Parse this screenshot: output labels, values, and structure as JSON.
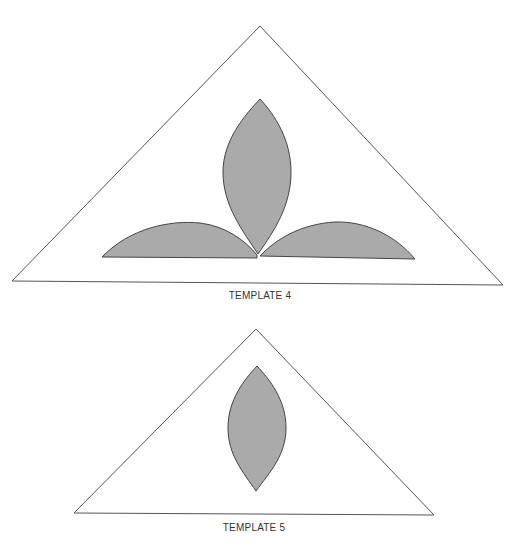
{
  "colors": {
    "background": "#ffffff",
    "outline": "#555555",
    "leaf_fill": "#aaaaaa",
    "leaf_stroke": "#444444",
    "label": "#333333"
  },
  "templates": [
    {
      "label": "TEMPLATE 4",
      "triangle": {
        "apex": [
          260,
          26
        ],
        "bottom_left": [
          12,
          281
        ],
        "bottom_right": [
          503,
          285
        ]
      },
      "leaves": [
        {
          "name": "center-leaf",
          "top": [
            260,
            99
          ],
          "bottom": [
            258,
            254
          ],
          "left_x": 223,
          "right_x": 291
        },
        {
          "name": "left-leaf",
          "left_tip": [
            102,
            257
          ],
          "right_tip": [
            257,
            258
          ],
          "peak_y": 223
        },
        {
          "name": "right-leaf",
          "left_tip": [
            259,
            256
          ],
          "right_tip": [
            415,
            259
          ],
          "peak_y": 222
        }
      ]
    },
    {
      "label": "TEMPLATE 5",
      "triangle": {
        "apex": [
          256,
          329
        ],
        "bottom_left": [
          74,
          513
        ],
        "bottom_right": [
          434,
          515
        ]
      },
      "leaves": [
        {
          "name": "center-leaf",
          "top": [
            257,
            366
          ],
          "bottom": [
            256,
            491
          ],
          "left_x": 228,
          "right_x": 286
        }
      ]
    }
  ]
}
